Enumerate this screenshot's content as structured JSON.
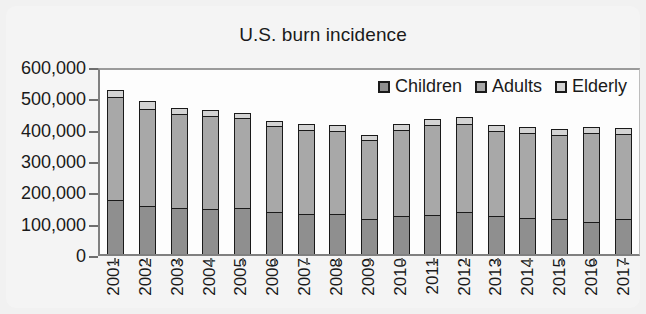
{
  "chart_data": {
    "type": "bar",
    "title": "U.S. burn incidence",
    "xlabel": "",
    "ylabel": "",
    "stacked": true,
    "grid": false,
    "legend_position": "top-right inside plot",
    "ylim": [
      0,
      600000
    ],
    "ytick_labels": [
      "600,000",
      "500,000",
      "400,000",
      "300,000",
      "200,000",
      "100,000",
      "0"
    ],
    "ytick_values": [
      600000,
      500000,
      400000,
      300000,
      200000,
      100000,
      0
    ],
    "categories": [
      "2001",
      "2002",
      "2003",
      "2004",
      "2005",
      "2006",
      "2007",
      "2008",
      "2009",
      "2010",
      "2011",
      "2012",
      "2013",
      "2014",
      "2015",
      "2016",
      "2017"
    ],
    "series": [
      {
        "name": "Children",
        "color": "#8f8f8f",
        "values": [
          168000,
          150000,
          145000,
          140000,
          145000,
          130000,
          125000,
          125000,
          110000,
          118000,
          122000,
          130000,
          118000,
          112000,
          110000,
          98000,
          110000
        ]
      },
      {
        "name": "Adults",
        "color": "#a8a8a8",
        "values": [
          330000,
          310000,
          300000,
          298000,
          285000,
          275000,
          268000,
          265000,
          250000,
          275000,
          285000,
          282000,
          272000,
          272000,
          268000,
          285000,
          270000
        ]
      },
      {
        "name": "Elderly",
        "color": "#d3d3d3",
        "values": [
          22000,
          25000,
          18000,
          20000,
          18000,
          18000,
          18000,
          18000,
          18000,
          20000,
          22000,
          22000,
          18000,
          18000,
          18000,
          18000,
          18000
        ]
      }
    ],
    "totals": [
      520000,
      485000,
      463000,
      458000,
      448000,
      423000,
      411000,
      408000,
      378000,
      413000,
      429000,
      434000,
      408000,
      402000,
      396000,
      401000,
      398000
    ]
  },
  "legend": {
    "items": [
      {
        "label": "Children",
        "swatch": "children-swatch"
      },
      {
        "label": "Adults",
        "swatch": "adults-swatch"
      },
      {
        "label": "Elderly",
        "swatch": "elderly-swatch"
      }
    ]
  }
}
